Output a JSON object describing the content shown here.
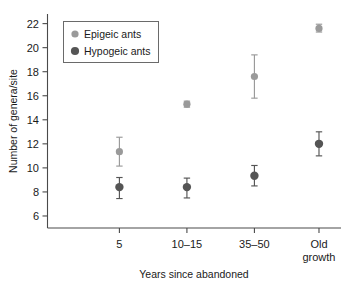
{
  "chart_data": {
    "type": "scatter",
    "title": "",
    "xlabel": "Years since abandoned",
    "ylabel": "Number of genera/site",
    "categories": [
      "5",
      "10–15",
      "35–50",
      "Old growth"
    ],
    "ylim": [
      5,
      22.8
    ],
    "yticks": [
      6,
      8,
      10,
      12,
      14,
      16,
      18,
      20,
      22
    ],
    "ytick_labels": [
      "6",
      "8",
      "10",
      "12",
      "14",
      "16",
      "18",
      "20",
      "22"
    ],
    "grid": false,
    "legend_position": "upper-left-inside",
    "series": [
      {
        "name": "Epigeic ants",
        "color": "#9a9a9a",
        "values": [
          11.35,
          15.3,
          17.6,
          21.6
        ],
        "err_low": [
          10.15,
          15.05,
          15.8,
          21.3
        ],
        "err_high": [
          12.55,
          15.55,
          19.4,
          21.95
        ]
      },
      {
        "name": "Hypogeic ants",
        "color": "#555555",
        "values": [
          8.4,
          8.4,
          9.35,
          12.0
        ],
        "err_low": [
          7.45,
          7.5,
          8.5,
          11.0
        ],
        "err_high": [
          9.2,
          9.15,
          10.2,
          13.0
        ]
      }
    ]
  },
  "legend": {
    "entries": [
      {
        "label": "Epigeic ants",
        "marker": "circle",
        "color": "#9a9a9a"
      },
      {
        "label": "Hypogeic ants",
        "marker": "circle",
        "color": "#555555"
      }
    ]
  },
  "axes": {
    "y_title": "Number of genera/site",
    "x_title": "Years since abandoned"
  }
}
